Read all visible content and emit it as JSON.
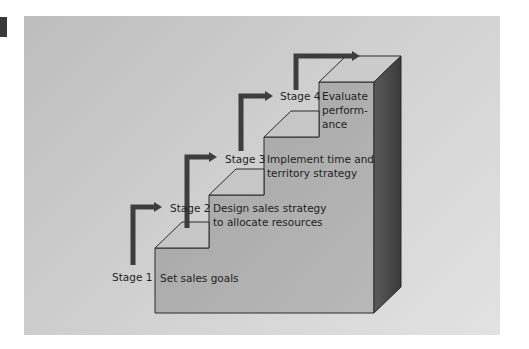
{
  "diagram": {
    "type": "staircase-process",
    "colors": {
      "panel_bg": "#c8c8c8",
      "step_front": "#a9a9a9",
      "step_top": "#c4c4c4",
      "step_side": "#4a4a4a",
      "arrow": "#3d3d3d",
      "outline": "#2a2a2a"
    },
    "stages": [
      {
        "label": "Stage 1",
        "description": "Set sales goals"
      },
      {
        "label": "Stage 2",
        "description": "Design sales strategy to allocate resources",
        "lines": [
          "Design sales strategy",
          "to allocate resources"
        ]
      },
      {
        "label": "Stage 3",
        "description": "Implement time and territory strategy",
        "lines": [
          "Implement time and",
          "territory strategy"
        ]
      },
      {
        "label": "Stage 4",
        "description": "Evaluate performance",
        "lines": [
          "Evaluate",
          "perform-",
          "ance"
        ]
      }
    ]
  }
}
